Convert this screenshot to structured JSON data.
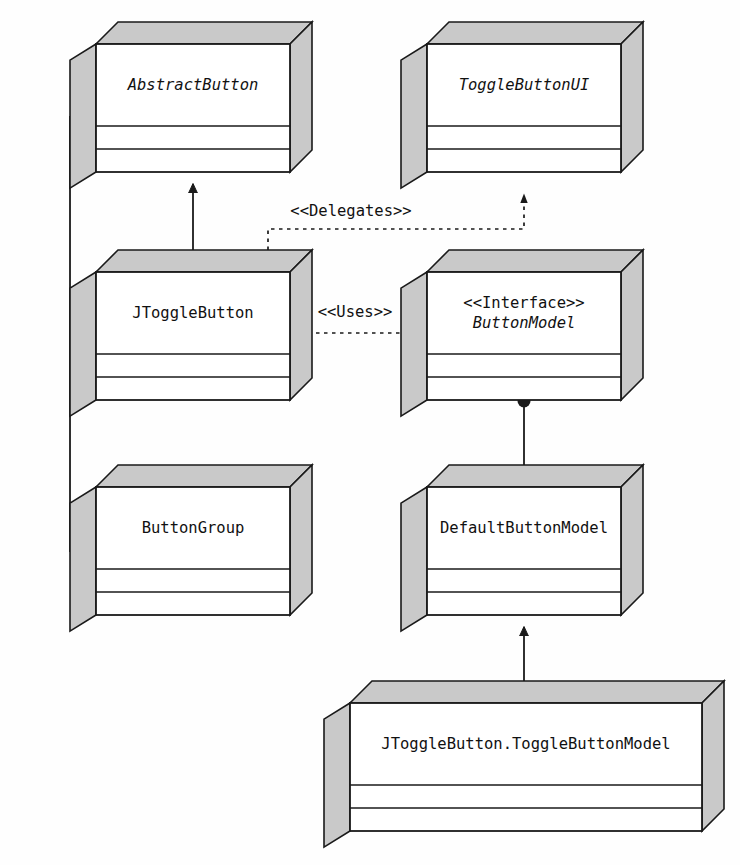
{
  "diagram": {
    "kind": "uml-class-diagram",
    "title": "",
    "canvas": {
      "width": 740,
      "height": 865,
      "background": "#fefefe"
    },
    "style": {
      "box_face_color": "#ffffff",
      "box_shade_color": "#c9c9c9",
      "stroke_color": "#1a1a1a",
      "text_color": "#111111"
    },
    "classes": [
      {
        "id": "abstract-button",
        "lines": [
          "AbstractButton"
        ],
        "italic": [
          true
        ],
        "stereotype": "",
        "abstract": true,
        "x": 96,
        "y": 44,
        "w": 194,
        "h": 128,
        "depth": 22
      },
      {
        "id": "toggle-button-ui",
        "lines": [
          "ToggleButtonUI"
        ],
        "italic": [
          true
        ],
        "stereotype": "",
        "abstract": true,
        "x": 427,
        "y": 44,
        "w": 194,
        "h": 128,
        "depth": 22
      },
      {
        "id": "jtoggle-button",
        "lines": [
          "JToggleButton"
        ],
        "italic": [
          false
        ],
        "stereotype": "",
        "abstract": false,
        "x": 96,
        "y": 272,
        "w": 194,
        "h": 128,
        "depth": 22
      },
      {
        "id": "button-model",
        "lines": [
          "<<Interface>>",
          "ButtonModel"
        ],
        "italic": [
          false,
          true
        ],
        "stereotype": "<<Interface>>",
        "abstract": true,
        "x": 427,
        "y": 272,
        "w": 194,
        "h": 128,
        "depth": 22
      },
      {
        "id": "button-group",
        "lines": [
          "ButtonGroup"
        ],
        "italic": [
          false
        ],
        "stereotype": "",
        "abstract": false,
        "x": 96,
        "y": 487,
        "w": 194,
        "h": 128,
        "depth": 22
      },
      {
        "id": "default-button-model",
        "lines": [
          "DefaultButtonModel"
        ],
        "italic": [
          false
        ],
        "stereotype": "",
        "abstract": false,
        "x": 427,
        "y": 487,
        "w": 194,
        "h": 128,
        "depth": 22
      },
      {
        "id": "jtoggle-button-toggle-button-model",
        "lines": [
          "JToggleButton.ToggleButtonModel"
        ],
        "italic": [
          false
        ],
        "stereotype": "",
        "abstract": false,
        "x": 350,
        "y": 703,
        "w": 352,
        "h": 128,
        "depth": 22
      }
    ],
    "relationships": [
      {
        "id": "inherit-jtoggle-abstractbutton",
        "type": "generalization",
        "line": "solid",
        "from": "jtoggle-button",
        "to": "abstract-button",
        "label": ""
      },
      {
        "id": "delegates-jtoggle-toggleui",
        "type": "dependency",
        "line": "dashed",
        "from": "jtoggle-button",
        "to": "toggle-button-ui",
        "label": "<<Delegates>>"
      },
      {
        "id": "uses-jtoggle-buttonmodel",
        "type": "dependency",
        "line": "dashed",
        "from": "jtoggle-button",
        "to": "button-model",
        "label": "<<Uses>>"
      },
      {
        "id": "realize-defaultmodel-buttonmodel",
        "type": "realization",
        "line": "solid",
        "from": "default-button-model",
        "to": "button-model",
        "label": ""
      },
      {
        "id": "inherit-togglemodel-defaultmodel",
        "type": "generalization",
        "line": "solid",
        "from": "jtoggle-button-toggle-button-model",
        "to": "default-button-model",
        "label": ""
      },
      {
        "id": "aggregation-buttongroup-abstractbutton",
        "type": "aggregation",
        "line": "solid",
        "from": "button-group",
        "to": "abstract-button",
        "label": "0..n"
      }
    ],
    "edge_labels": {
      "multiplicity": "0..n",
      "delegates": "<<Delegates>>",
      "uses": "<<Uses>>"
    }
  }
}
